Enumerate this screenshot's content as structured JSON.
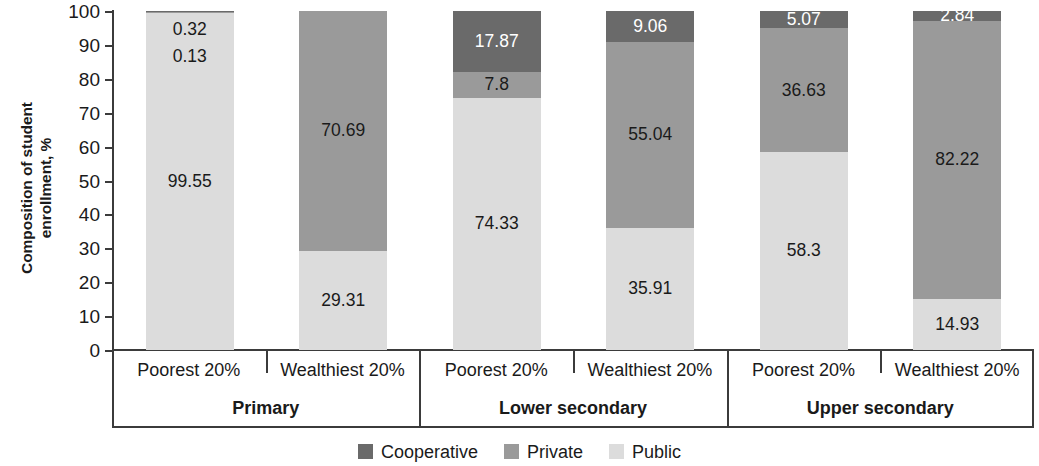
{
  "chart_data": {
    "type": "bar",
    "stacked": true,
    "title": "",
    "xlabel": "",
    "ylabel": "Composition of student enrollment, %",
    "ylim": [
      0,
      100
    ],
    "yticks": [
      0,
      10,
      20,
      30,
      40,
      50,
      60,
      70,
      80,
      90,
      100
    ],
    "grid": false,
    "legend_position": "bottom",
    "groups": [
      {
        "label": "Primary",
        "categories": [
          "Poorest 20%",
          "Wealthiest 20%"
        ]
      },
      {
        "label": "Lower secondary",
        "categories": [
          "Poorest 20%",
          "Wealthiest 20%"
        ]
      },
      {
        "label": "Upper secondary",
        "categories": [
          "Poorest 20%",
          "Wealthiest 20%"
        ]
      }
    ],
    "categories": [
      "Primary / Poorest 20%",
      "Primary / Wealthiest 20%",
      "Lower secondary / Poorest 20%",
      "Lower secondary / Wealthiest 20%",
      "Upper secondary / Poorest 20%",
      "Upper secondary / Wealthiest 20%"
    ],
    "series": [
      {
        "name": "Cooperative",
        "color": "#6a6a6a",
        "values": [
          0.32,
          0.0,
          17.87,
          9.06,
          5.07,
          2.84
        ]
      },
      {
        "name": "Private",
        "color": "#9a9a9a",
        "values": [
          0.13,
          70.69,
          7.8,
          55.04,
          36.63,
          82.22
        ]
      },
      {
        "name": "Public",
        "color": "#dcdcdc",
        "values": [
          99.55,
          29.31,
          74.33,
          35.91,
          58.3,
          14.93
        ]
      }
    ],
    "bars": [
      {
        "group": "Primary",
        "category": "Poorest 20%",
        "segments": [
          {
            "series": "Cooperative",
            "value": 0.32,
            "label": "0.32",
            "color": "#6a6a6a",
            "text_color": "#1a1a1a",
            "label_mode": "float",
            "float_offset": 10
          },
          {
            "series": "Private",
            "value": 0.13,
            "label": "0.13",
            "color": "#9a9a9a",
            "text_color": "#1a1a1a",
            "label_mode": "float",
            "float_offset": 37
          },
          {
            "series": "Public",
            "value": 99.55,
            "label": "99.55",
            "color": "#dcdcdc",
            "text_color": "#1a1a1a",
            "label_mode": "inside"
          }
        ]
      },
      {
        "group": "Primary",
        "category": "Wealthiest 20%",
        "segments": [
          {
            "series": "Private",
            "value": 70.69,
            "label": "70.69",
            "color": "#9a9a9a",
            "text_color": "#1a1a1a",
            "label_mode": "inside"
          },
          {
            "series": "Public",
            "value": 29.31,
            "label": "29.31",
            "color": "#dcdcdc",
            "text_color": "#1a1a1a",
            "label_mode": "inside"
          }
        ]
      },
      {
        "group": "Lower secondary",
        "category": "Poorest 20%",
        "segments": [
          {
            "series": "Cooperative",
            "value": 17.87,
            "label": "17.87",
            "color": "#6a6a6a",
            "text_color": "#ffffff",
            "label_mode": "inside"
          },
          {
            "series": "Private",
            "value": 7.8,
            "label": "7.8",
            "color": "#9a9a9a",
            "text_color": "#1a1a1a",
            "label_mode": "inside"
          },
          {
            "series": "Public",
            "value": 74.33,
            "label": "74.33",
            "color": "#dcdcdc",
            "text_color": "#1a1a1a",
            "label_mode": "inside"
          }
        ]
      },
      {
        "group": "Lower secondary",
        "category": "Wealthiest 20%",
        "segments": [
          {
            "series": "Cooperative",
            "value": 9.06,
            "label": "9.06",
            "color": "#6a6a6a",
            "text_color": "#ffffff",
            "label_mode": "inside"
          },
          {
            "series": "Private",
            "value": 55.04,
            "label": "55.04",
            "color": "#9a9a9a",
            "text_color": "#1a1a1a",
            "label_mode": "inside"
          },
          {
            "series": "Public",
            "value": 35.91,
            "label": "35.91",
            "color": "#dcdcdc",
            "text_color": "#1a1a1a",
            "label_mode": "inside"
          }
        ]
      },
      {
        "group": "Upper secondary",
        "category": "Poorest 20%",
        "segments": [
          {
            "series": "Cooperative",
            "value": 5.07,
            "label": "5.07",
            "color": "#6a6a6a",
            "text_color": "#ffffff",
            "label_mode": "inside"
          },
          {
            "series": "Private",
            "value": 36.63,
            "label": "36.63",
            "color": "#9a9a9a",
            "text_color": "#1a1a1a",
            "label_mode": "inside"
          },
          {
            "series": "Public",
            "value": 58.3,
            "label": "58.3",
            "color": "#dcdcdc",
            "text_color": "#1a1a1a",
            "label_mode": "inside"
          }
        ]
      },
      {
        "group": "Upper secondary",
        "category": "Wealthiest 20%",
        "segments": [
          {
            "series": "Cooperative",
            "value": 2.84,
            "label": "2.84",
            "color": "#6a6a6a",
            "text_color": "#ffffff",
            "label_mode": "inside"
          },
          {
            "series": "Private",
            "value": 82.22,
            "label": "82.22",
            "color": "#9a9a9a",
            "text_color": "#1a1a1a",
            "label_mode": "inside"
          },
          {
            "series": "Public",
            "value": 14.93,
            "label": "14.93",
            "color": "#dcdcdc",
            "text_color": "#1a1a1a",
            "label_mode": "inside"
          }
        ]
      }
    ],
    "legend": [
      {
        "label": "Cooperative",
        "color": "#6a6a6a"
      },
      {
        "label": "Private",
        "color": "#9a9a9a"
      },
      {
        "label": "Public",
        "color": "#dcdcdc"
      }
    ]
  },
  "axis": {
    "y_title_line1": "Composition of student",
    "y_title_line2": "enrollment, %"
  }
}
